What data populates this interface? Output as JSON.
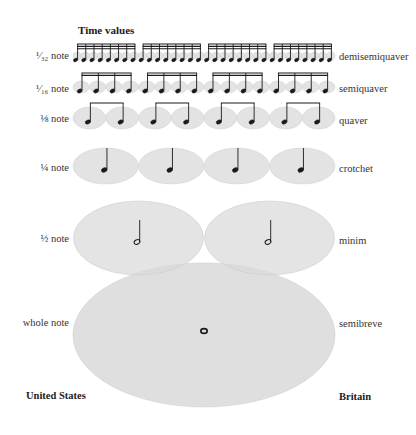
{
  "title": "Time values",
  "colors": {
    "ellipse_fill": "#d9d9d9",
    "ellipse_stroke": "#c8c8c8",
    "note": "#1a1a1a",
    "background": "#ffffff"
  },
  "rows": [
    {
      "us": "1/32 note",
      "us_display": "⅓₂ note",
      "uk": "demisemiquaver",
      "count": 32,
      "group": 8,
      "beams": 3
    },
    {
      "us": "1/16 note",
      "us_display": "¹⁄₁₆ note",
      "uk": "semiquaver",
      "count": 16,
      "group": 4,
      "beams": 2
    },
    {
      "us": "1/8 note",
      "us_display": "⅛ note",
      "uk": "quaver",
      "count": 8,
      "group": 2,
      "beams": 1
    },
    {
      "us": "1/4 note",
      "us_display": "¼ note",
      "uk": "crotchet",
      "count": 4,
      "group": 1,
      "beams": 0
    },
    {
      "us": "1/2 note",
      "us_display": "½ note",
      "uk": "minim",
      "count": 2,
      "group": 1,
      "beams": 0
    },
    {
      "us": "whole note",
      "us_display": "whole note",
      "uk": "semibreve",
      "count": 1,
      "group": 1,
      "beams": 0
    }
  ],
  "labels": {
    "r0_us": "¹⁄₃₂ note",
    "r0_uk": "demisemiquaver",
    "r1_us": "¹⁄₁₆ note",
    "r1_uk": "semiquaver",
    "r2_us": "⅛ note",
    "r2_uk": "quaver",
    "r3_us": "¼ note",
    "r3_uk": "crotchet",
    "r4_us": "½ note",
    "r4_uk": "minim",
    "r5_us": "whole note",
    "r5_uk": "semibreve"
  },
  "footer": {
    "left": "United States",
    "right": "Britain"
  }
}
